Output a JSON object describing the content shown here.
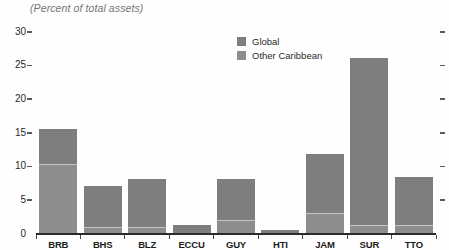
{
  "subtitle": "(Percent of total assets)",
  "colors": {
    "axis": "#2b2b2b",
    "tick": "#5a5a5a",
    "divider": "#c4c4c4",
    "text": "#2a2a2a",
    "subtitle_text": "#757575"
  },
  "chart_data": {
    "type": "bar",
    "stacked": true,
    "subtitle": "(Percent of total assets)",
    "categories": [
      "BRB",
      "BHS",
      "BLZ",
      "ECCU",
      "GUY",
      "HTI",
      "JAM",
      "SUR",
      "TTO"
    ],
    "series": [
      {
        "name": "Global",
        "color": "#7e7e7e",
        "values": [
          5.2,
          6.1,
          7.1,
          1.2,
          6.0,
          0.4,
          8.9,
          24.8,
          7.1
        ]
      },
      {
        "name": "Other Caribbean",
        "color": "#8d8d8d",
        "values": [
          10.2,
          0.9,
          0.9,
          0.0,
          2.0,
          0.0,
          2.9,
          1.2,
          1.2
        ]
      }
    ],
    "totals": [
      15.4,
      7.0,
      8.0,
      1.2,
      8.0,
      0.4,
      11.8,
      26.0,
      8.3
    ],
    "stack_order": "legend-top-first",
    "xlabel": "",
    "ylabel": "",
    "ylim": [
      0,
      30
    ],
    "yticks": [
      0,
      5,
      10,
      15,
      20,
      25,
      30
    ],
    "grid": false,
    "legend_position": "top-center",
    "axis_ticks_right": true
  }
}
